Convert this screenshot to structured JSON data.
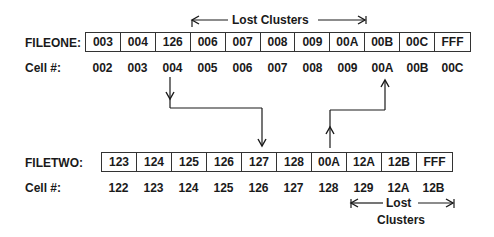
{
  "fileone": {
    "label": "FILEONE:",
    "cells": [
      "003",
      "004",
      "126",
      "006",
      "007",
      "008",
      "009",
      "00A",
      "00B",
      "00C",
      "FFF"
    ],
    "cell_label": "Cell #:",
    "cell_numbers": [
      "002",
      "003",
      "004",
      "005",
      "006",
      "007",
      "008",
      "009",
      "00A",
      "00B",
      "00C"
    ],
    "lost_clusters_label": "Lost Clusters"
  },
  "filetwo": {
    "label": "FILETWO:",
    "cells": [
      "123",
      "124",
      "125",
      "126",
      "127",
      "128",
      "00A",
      "12A",
      "12B",
      "FFF"
    ],
    "cell_label": "Cell #:",
    "cell_numbers": [
      "122",
      "123",
      "124",
      "125",
      "126",
      "127",
      "128",
      "129",
      "12A",
      "12B"
    ],
    "lost_label_line1": "Lost",
    "lost_label_line2": "Clusters"
  },
  "links": [
    {
      "from": "FILEONE cell 004 (value 126)",
      "to": "FILETWO cell 126 (value 127)"
    },
    {
      "from": "FILETWO cell 128 (value 00A)",
      "to": "FILEONE cell 00A"
    }
  ],
  "colors": {
    "line": "#1a1a1a",
    "background": "#ffffff"
  }
}
